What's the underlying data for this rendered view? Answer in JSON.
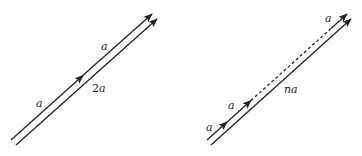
{
  "diagrams": [
    {
      "name": "left",
      "description": "Two consecutive vectors a + a equal 2a",
      "upper_vector_label_1": "a",
      "upper_vector_label_2": "a",
      "lower_vector_label": "2a",
      "lower_vector_label_num": "2",
      "lower_vector_label_var": "a"
    },
    {
      "name": "right",
      "description": "n consecutive vectors a sum to na",
      "upper_vector_label_1": "a",
      "upper_vector_label_2": "a",
      "upper_vector_label_last": "a",
      "lower_vector_label": "na",
      "lower_vector_label_num": "n",
      "lower_vector_label_var": "a"
    }
  ],
  "colors": {
    "stroke": "#222222",
    "background": "#ffffff"
  }
}
